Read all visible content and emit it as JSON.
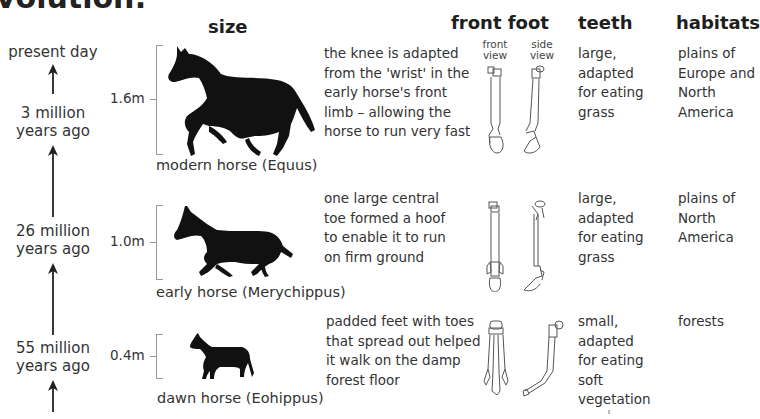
{
  "title": "volution:",
  "headers": {
    "size": "size",
    "front_foot": "front foot",
    "teeth": "teeth",
    "habitats": "habitats"
  },
  "foot_views": {
    "front": "front\nview",
    "front_line1": "front",
    "front_line2": "view",
    "side_line1": "side",
    "side_line2": "view"
  },
  "timeline": [
    {
      "label": "present day"
    },
    {
      "label_line1": "3 million",
      "label_line2": "years ago"
    },
    {
      "label_line1": "26 million",
      "label_line2": "years ago"
    },
    {
      "label_line1": "55 million",
      "label_line2": "years ago"
    }
  ],
  "horses": [
    {
      "name": "modern horse (Equus)",
      "height": "1.6m",
      "foot_description": "the knee is adapted\nfrom the 'wrist' in the\nearly horse's front\nlimb – allowing the\nhorse to run very fast",
      "teeth": "large,\nadapted\nfor eating\ngrass",
      "habitat": "plains of\nEurope and\nNorth\nAmerica",
      "icon": "horse-silhouette-icon"
    },
    {
      "name": "early horse (Merychippus)",
      "height": "1.0m",
      "foot_description": "one large central\ntoe formed a hoof\nto enable it to run\non firm ground",
      "teeth": "large,\nadapted\nfor eating\ngrass",
      "habitat": "plains of\nNorth\nAmerica",
      "icon": "horse-silhouette-icon"
    },
    {
      "name": "dawn horse (Eohippus)",
      "height": "0.4m",
      "foot_description": "padded feet with toes\nthat spread out helped\nit walk on the damp\nforest floor",
      "teeth": "small,\nadapted\nfor eating\nsoft\nvegetation",
      "habitat": "forests",
      "icon": "horse-silhouette-icon"
    }
  ],
  "colors": {
    "text": "#333333",
    "silhouette": "#111111",
    "bracket": "#9a9a9a",
    "bone_stroke": "#555555"
  }
}
